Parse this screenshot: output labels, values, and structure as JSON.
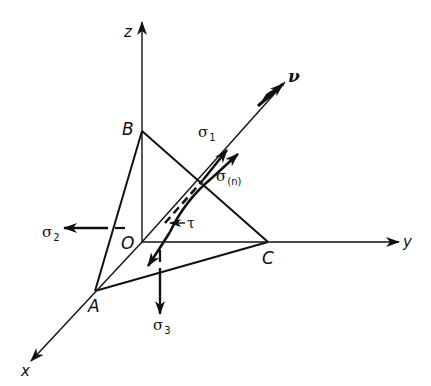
{
  "figure": {
    "type": "stress-tetrahedron",
    "colors": {
      "stroke": "#111111",
      "background": "#ffffff"
    },
    "axes": {
      "x": {
        "label": "x"
      },
      "y": {
        "label": "y"
      },
      "z": {
        "label": "z"
      },
      "nu": {
        "label": "ν"
      }
    },
    "points": {
      "origin": {
        "label": "O"
      },
      "a": {
        "label": "A"
      },
      "b": {
        "label": "B"
      },
      "c": {
        "label": "C"
      }
    },
    "vectors": {
      "sigma1": {
        "symbol": "σ",
        "sub": "1"
      },
      "sigma2": {
        "symbol": "σ",
        "sub": "2"
      },
      "sigma3": {
        "symbol": "σ",
        "sub": "3"
      },
      "sigma_n": {
        "symbol": "σ",
        "sub": "(n)"
      },
      "tau": {
        "symbol": "τ"
      }
    }
  }
}
